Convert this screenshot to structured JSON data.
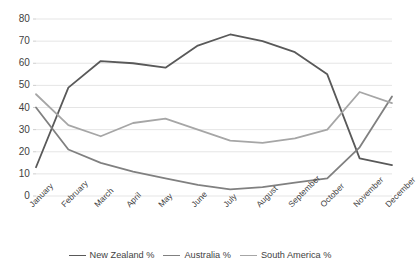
{
  "chart_data": {
    "type": "line",
    "title": "",
    "xlabel": "",
    "ylabel": "",
    "categories": [
      "January",
      "February",
      "March",
      "April",
      "May",
      "June",
      "July",
      "August",
      "September",
      "October",
      "November",
      "December"
    ],
    "ylim": [
      0,
      80
    ],
    "ytick_values": [
      0,
      10,
      20,
      30,
      40,
      50,
      60,
      70,
      80
    ],
    "ytick_labels": [
      "0",
      "10",
      "20",
      "30",
      "40",
      "50",
      "60",
      "70",
      "80"
    ],
    "grid": "horizontal",
    "legend_position": "bottom",
    "series": [
      {
        "name": "New Zealand %",
        "color": "#595959",
        "values": [
          13,
          49,
          61,
          60,
          58,
          68,
          73,
          70,
          65,
          55,
          17,
          14
        ]
      },
      {
        "name": "Australia %",
        "color": "#808080",
        "values": [
          40,
          21,
          15,
          11,
          8,
          5,
          3,
          4,
          6,
          8,
          22,
          45
        ]
      },
      {
        "name": "South America %",
        "color": "#a6a6a6",
        "values": [
          46,
          32,
          27,
          33,
          35,
          30,
          25,
          24,
          26,
          30,
          47,
          42
        ]
      }
    ]
  },
  "legend": {
    "items": [
      {
        "label": "New Zealand %",
        "color": "#595959"
      },
      {
        "label": "Australia %",
        "color": "#808080"
      },
      {
        "label": "South America %",
        "color": "#a6a6a6"
      }
    ]
  }
}
